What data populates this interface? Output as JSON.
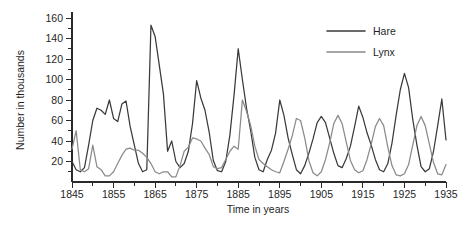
{
  "chart_data": {
    "type": "line",
    "title": "",
    "xlabel": "Time in years",
    "ylabel": "Number in thousands",
    "xlim": [
      1845,
      1935
    ],
    "ylim": [
      0,
      160
    ],
    "xticks": [
      1845,
      1855,
      1865,
      1875,
      1885,
      1895,
      1905,
      1915,
      1925,
      1935
    ],
    "xtick_labels": [
      "1845",
      "1855",
      "1865",
      "1875",
      "1885",
      "1895",
      "1905",
      "1915",
      "1925",
      "1935"
    ],
    "x_minor_step": 5,
    "yticks": [
      20,
      40,
      60,
      80,
      100,
      120,
      140,
      160
    ],
    "ytick_labels": [
      "20",
      "40",
      "60",
      "80",
      "100",
      "120",
      "140",
      "160"
    ],
    "y_minor_step": 10,
    "grid": false,
    "legend_position": "top-right",
    "x": [
      1845,
      1846,
      1847,
      1848,
      1849,
      1850,
      1851,
      1852,
      1853,
      1854,
      1855,
      1856,
      1857,
      1858,
      1859,
      1860,
      1861,
      1862,
      1863,
      1864,
      1865,
      1866,
      1867,
      1868,
      1869,
      1870,
      1871,
      1872,
      1873,
      1874,
      1875,
      1876,
      1877,
      1878,
      1879,
      1880,
      1881,
      1882,
      1883,
      1884,
      1885,
      1886,
      1887,
      1888,
      1889,
      1890,
      1891,
      1892,
      1893,
      1894,
      1895,
      1896,
      1897,
      1898,
      1899,
      1900,
      1901,
      1902,
      1903,
      1904,
      1905,
      1906,
      1907,
      1908,
      1909,
      1910,
      1911,
      1912,
      1913,
      1914,
      1915,
      1916,
      1917,
      1918,
      1919,
      1920,
      1921,
      1922,
      1923,
      1924,
      1925,
      1926,
      1927,
      1928,
      1929,
      1930,
      1931,
      1932,
      1933,
      1934,
      1935
    ],
    "series": [
      {
        "name": "Hare",
        "color": "#3a3a3a",
        "values": [
          20,
          12,
          10,
          14,
          36,
          60,
          72,
          70,
          66,
          80,
          62,
          59,
          76,
          79,
          54,
          36,
          18,
          10,
          12,
          153,
          142,
          114,
          86,
          30,
          40,
          20,
          14,
          18,
          30,
          57,
          99,
          82,
          70,
          49,
          21,
          11,
          10,
          20,
          46,
          85,
          130,
          100,
          72,
          50,
          24,
          12,
          10,
          22,
          31,
          48,
          80,
          65,
          43,
          27,
          12,
          8,
          16,
          28,
          42,
          58,
          64,
          58,
          43,
          28,
          16,
          14,
          23,
          35,
          54,
          74,
          63,
          48,
          36,
          22,
          12,
          10,
          18,
          38,
          65,
          90,
          106,
          92,
          61,
          36,
          15,
          10,
          13,
          30,
          55,
          81,
          41
        ]
      },
      {
        "name": "Lynx",
        "color": "#8a8a8a",
        "values": [
          32,
          50,
          12,
          10,
          13,
          36,
          15,
          12,
          6,
          6,
          10,
          18,
          26,
          32,
          33,
          31,
          31,
          28,
          24,
          18,
          10,
          8,
          10,
          10,
          5,
          5,
          16,
          30,
          34,
          43,
          42,
          40,
          33,
          27,
          15,
          13,
          14,
          22,
          30,
          35,
          32,
          80,
          69,
          55,
          35,
          22,
          18,
          15,
          12,
          10,
          9,
          20,
          32,
          45,
          62,
          60,
          43,
          21,
          9,
          6,
          10,
          22,
          38,
          57,
          65,
          57,
          39,
          21,
          12,
          9,
          11,
          22,
          37,
          54,
          62,
          55,
          34,
          16,
          7,
          6,
          8,
          17,
          36,
          55,
          64,
          55,
          37,
          19,
          8,
          7,
          17
        ]
      }
    ],
    "legend": [
      {
        "label": "Hare",
        "color": "#3a3a3a"
      },
      {
        "label": "Lynx",
        "color": "#8a8a8a"
      }
    ]
  }
}
